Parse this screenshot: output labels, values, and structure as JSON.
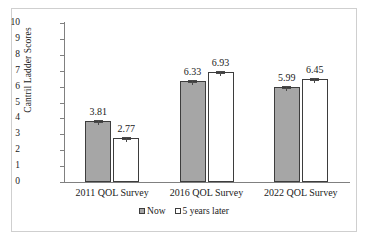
{
  "chart_data": {
    "type": "bar",
    "title": "",
    "xlabel": "",
    "ylabel": "Cantril Ladder Scores",
    "categories": [
      "2011 QOL Survey",
      "2016 QOL Survey",
      "2022 QOL Survey"
    ],
    "series": [
      {
        "name": "Now",
        "values": [
          3.81,
          6.33,
          5.99
        ],
        "color": "#a6a6a6"
      },
      {
        "name": "5 years later",
        "values": [
          2.77,
          6.93,
          6.45
        ],
        "color": "#ffffff"
      }
    ],
    "data_labels": [
      [
        "3.81",
        "2.77"
      ],
      [
        "6.33",
        "6.93"
      ],
      [
        "5.99",
        "6.45"
      ]
    ],
    "ylim": [
      0,
      10
    ],
    "ytick_values": [
      10,
      9,
      8,
      7,
      6,
      5,
      4,
      3,
      2,
      1,
      0
    ],
    "ytick_labels": [
      "10",
      "9",
      "8",
      "7",
      "6",
      "5",
      "4",
      "3",
      "2",
      "1",
      "0"
    ],
    "grid": false,
    "error_bars": true,
    "legend_position": "bottom",
    "legend_entries": [
      "Now",
      "5 years later"
    ]
  }
}
